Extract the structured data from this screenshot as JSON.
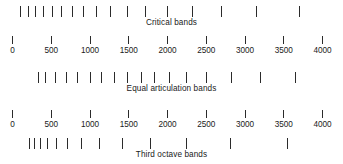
{
  "chart_data": {
    "type": "bar",
    "title": "",
    "subtitle": "",
    "xlabel": "Frequency (Hz)",
    "ylabel": "",
    "xlim": [
      0,
      4000
    ],
    "grid": false,
    "legend_position": "none",
    "annotations": [
      "Critical bands",
      "Equal articulation bands",
      "Third octave bands"
    ],
    "axis": {
      "tick_values": [
        0,
        500,
        1000,
        1500,
        2000,
        2500,
        3000,
        3500,
        4000
      ],
      "tick_labels": [
        "0",
        "500",
        "1000",
        "1500",
        "2000",
        "2500",
        "3000",
        "3500",
        "4000"
      ],
      "pixel_origin_x": 12,
      "pixel_per_hz": 0.0775
    },
    "series": [
      {
        "name": "Critical bands",
        "values": [
          100,
          200,
          300,
          400,
          510,
          630,
          770,
          920,
          1080,
          1270,
          1480,
          1720,
          2000,
          2320,
          2700,
          3150,
          3700
        ]
      },
      {
        "name": "Equal articulation bands",
        "values": [
          330,
          430,
          560,
          700,
          840,
          1000,
          1150,
          1310,
          1480,
          1660,
          1830,
          2020,
          2240,
          2500,
          2820,
          3200,
          3650
        ]
      },
      {
        "name": "Third octave bands",
        "values": [
          224,
          282,
          355,
          447,
          562,
          708,
          891,
          1122,
          1413,
          1778,
          2239,
          2818,
          3548
        ]
      }
    ]
  },
  "rows": [
    {
      "id": "critical-bands",
      "caption": "Critical bands",
      "series_index": 0
    },
    {
      "id": "equal-artic",
      "caption": "Equal articulation bands",
      "series_index": 1
    },
    {
      "id": "third-octave",
      "caption": "Third octave bands",
      "series_index": 2
    }
  ],
  "colors": {
    "ink": "#1a1a1a",
    "tick": "#2b2b2b",
    "background": "#ffffff"
  }
}
